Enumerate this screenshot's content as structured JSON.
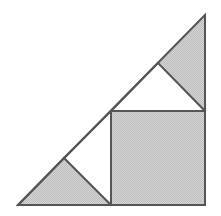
{
  "figure": {
    "background_color": "#ffffff",
    "line_color": "#555555",
    "shade_color": "#c8c8c8",
    "shade_color_light": "#dcdcdc",
    "white_color": "#ffffff",
    "line_width": 2,
    "canvas": {
      "width": 221,
      "height": 216
    }
  },
  "chart_data": {
    "type": "diagram",
    "coordinate_space": {
      "x_range": [
        0,
        221
      ],
      "y_range": [
        0,
        216
      ],
      "origin": "top-left"
    },
    "vertices": {
      "A_bottom_left": [
        18,
        205
      ],
      "B_bottom_right": [
        205,
        205
      ],
      "C_top_right": [
        205,
        15
      ],
      "D_hyp_lower_mid": [
        64,
        158
      ],
      "E_square_top_left": [
        111,
        111
      ],
      "F_hyp_upper_mid": [
        158,
        63
      ],
      "G_square_bottom_left": [
        111,
        205
      ],
      "H_square_top_right": [
        205,
        111
      ]
    },
    "shapes": [
      {
        "name": "outer-right-triangle",
        "kind": "triangle",
        "points": [
          [
            18,
            205
          ],
          [
            205,
            205
          ],
          [
            205,
            15
          ]
        ],
        "fill": "none",
        "stroke": "#555555",
        "legs": {
          "horizontal": 187,
          "vertical": 190
        }
      },
      {
        "name": "shaded-square",
        "kind": "square",
        "points": [
          [
            111,
            111
          ],
          [
            205,
            111
          ],
          [
            205,
            205
          ],
          [
            111,
            205
          ]
        ],
        "fill": "#c8c8c8",
        "stroke": "#555555",
        "side": 94
      },
      {
        "name": "shaded-lower-left-triangle",
        "kind": "triangle",
        "points": [
          [
            18,
            205
          ],
          [
            111,
            205
          ],
          [
            64,
            158
          ]
        ],
        "fill": "#c8c8c8",
        "stroke": "#555555",
        "base": 93,
        "height": 47
      },
      {
        "name": "shaded-upper-right-triangle",
        "kind": "triangle",
        "points": [
          [
            158,
            63
          ],
          [
            205,
            15
          ],
          [
            205,
            111
          ]
        ],
        "fill": "#c8c8c8",
        "stroke": "#555555",
        "base": 96,
        "height": 47
      },
      {
        "name": "white-lower-triangle",
        "kind": "triangle",
        "points": [
          [
            64,
            158
          ],
          [
            111,
            111
          ],
          [
            111,
            205
          ]
        ],
        "fill": "#ffffff",
        "stroke": "#555555",
        "base": 94,
        "height": 47
      },
      {
        "name": "white-upper-triangle",
        "kind": "triangle",
        "points": [
          [
            111,
            111
          ],
          [
            158,
            63
          ],
          [
            205,
            111
          ]
        ],
        "fill": "#ffffff",
        "stroke": "#555555",
        "base": 94,
        "height": 48
      }
    ],
    "annotations": [],
    "labels": [],
    "legend": null,
    "grid": false
  }
}
